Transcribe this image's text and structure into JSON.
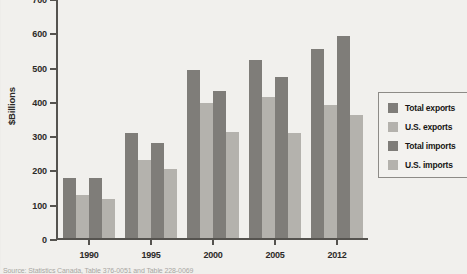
{
  "figure": {
    "axis_title": "$Billions",
    "source_note": "Source: Statistics Canada, Table 376-0051 and Table 228-0069"
  },
  "legend": {
    "items": [
      {
        "label": "Total exports",
        "swatch": "dark",
        "color": "#7f7d79"
      },
      {
        "label": "U.S. exports",
        "swatch": "light",
        "color": "#b4b2ad"
      },
      {
        "label": "Total imports",
        "swatch": "dark",
        "color": "#7f7d79"
      },
      {
        "label": "U.S. imports",
        "swatch": "light",
        "color": "#b4b2ad"
      }
    ]
  },
  "chart_data": {
    "type": "bar",
    "title": "",
    "xlabel": "",
    "ylabel": "$Billions",
    "ylim": [
      0,
      700
    ],
    "yticks": [
      0,
      100,
      200,
      300,
      400,
      500,
      600,
      700
    ],
    "grid": false,
    "legend_position": "right",
    "categories": [
      "1990",
      "1995",
      "2000",
      "2005",
      "2012"
    ],
    "series": [
      {
        "name": "Total exports",
        "color": "#7f7d79",
        "values": [
          175,
          305,
          490,
          520,
          550
        ]
      },
      {
        "name": "U.S. exports",
        "color": "#b4b2ad",
        "values": [
          125,
          228,
          395,
          410,
          388
        ]
      },
      {
        "name": "Total imports",
        "color": "#7f7d79",
        "values": [
          175,
          278,
          430,
          470,
          590
        ]
      },
      {
        "name": "U.S. imports",
        "color": "#b4b2ad",
        "values": [
          115,
          200,
          310,
          305,
          360
        ]
      }
    ]
  }
}
